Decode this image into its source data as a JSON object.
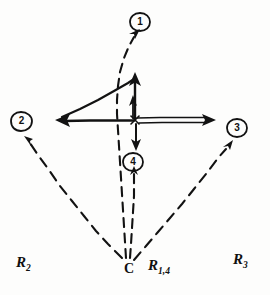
{
  "figure": {
    "background_color": "#fdfdfc",
    "ink_color": "#121212",
    "width": 270,
    "height": 295
  },
  "nodes": [
    {
      "id": "node-1",
      "label": "1",
      "x": 140,
      "y": 22,
      "note": "circled numeral at top of figure"
    },
    {
      "id": "node-2",
      "label": "2",
      "x": 21,
      "y": 121,
      "note": "circled numeral at left of figure"
    },
    {
      "id": "node-3",
      "label": "3",
      "x": 237,
      "y": 128,
      "note": "circled numeral at right of figure"
    },
    {
      "id": "node-4",
      "label": "4",
      "x": 133,
      "y": 162,
      "note": "circled numeral below centre"
    }
  ],
  "point_labels": [
    {
      "id": "point-c",
      "text": "C",
      "x": 124,
      "y": 262,
      "note": "common origin where dashed rays converge"
    }
  ],
  "region_labels": [
    {
      "id": "region-r2",
      "base": "R",
      "sub": "2",
      "x": 16,
      "y": 255
    },
    {
      "id": "region-r14",
      "base": "R",
      "sub": "1,4",
      "x": 148,
      "y": 258
    },
    {
      "id": "region-r3",
      "base": "R",
      "sub": "3",
      "x": 233,
      "y": 252
    }
  ],
  "dashed_rays": [
    {
      "id": "ray-c-to-2",
      "from": "C",
      "to": "2",
      "style": "dashed",
      "arrow": "at-node-2"
    },
    {
      "id": "ray-c-to-3",
      "from": "C",
      "to": "3",
      "style": "dashed",
      "arrow": "at-node-3"
    },
    {
      "id": "ray-c-to-4",
      "from": "C",
      "to": "4",
      "style": "dashed",
      "arrow": "at-node-4"
    },
    {
      "id": "ray-c-to-1",
      "from": "C",
      "to": "1",
      "style": "dashed",
      "arrow": "at-node-1"
    }
  ],
  "solid_vectors": [
    {
      "id": "vector-horizontal-left",
      "direction": "left",
      "arrow": "single-head",
      "note": "long horizontal arrow pointing left toward node 2"
    },
    {
      "id": "vector-horizontal-right",
      "direction": "right",
      "arrow": "single-head",
      "note": "thin elongated arrow pointing right toward node 3"
    },
    {
      "id": "vector-diagonal-apex",
      "direction": "up-right",
      "arrow": "none",
      "note": "diagonal edge from left arrowhead up to apex"
    },
    {
      "id": "vector-vertical-apex",
      "direction": "up",
      "arrow": "single-head",
      "note": "tall vertical arrow from centre up to apex"
    },
    {
      "id": "vector-vertical-short",
      "direction": "up",
      "arrow": "single-head",
      "note": "shorter vertical arrow inside the triangle"
    },
    {
      "id": "vector-down-to-4",
      "direction": "down",
      "arrow": "single-head",
      "note": "short downward arrow from centre toward node 4"
    },
    {
      "id": "vector-up-from-below",
      "direction": "up",
      "arrow": "single-head",
      "note": "short upward arrow below node 4"
    }
  ]
}
